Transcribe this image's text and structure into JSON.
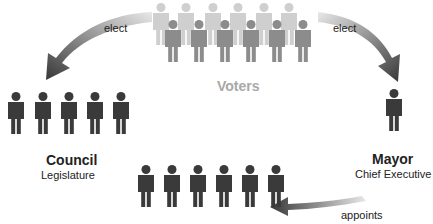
{
  "diagram": {
    "type": "mayor-council government structure",
    "nodes": {
      "voters": {
        "title": "Voters",
        "count_front": 6,
        "count_back": 6
      },
      "council": {
        "title": "Council",
        "subtitle": "Legislature",
        "count": 5
      },
      "mayor": {
        "title": "Mayor",
        "subtitle": "Chief Executive",
        "count": 1
      },
      "departments": {
        "count": 6
      }
    },
    "edges": [
      {
        "from": "voters",
        "to": "council",
        "label": "elect"
      },
      {
        "from": "voters",
        "to": "mayor",
        "label": "elect"
      },
      {
        "from": "mayor",
        "to": "departments",
        "label": "appoints"
      }
    ],
    "colors": {
      "figure_dark": "#3a3a3a",
      "voters_front": "#8c8c8c",
      "voters_back": "#cfcfcf",
      "voters_label": "#a8a8a8",
      "arrow_dark": "#3c3c3c",
      "arrow_light": "#e6e6e6"
    }
  }
}
